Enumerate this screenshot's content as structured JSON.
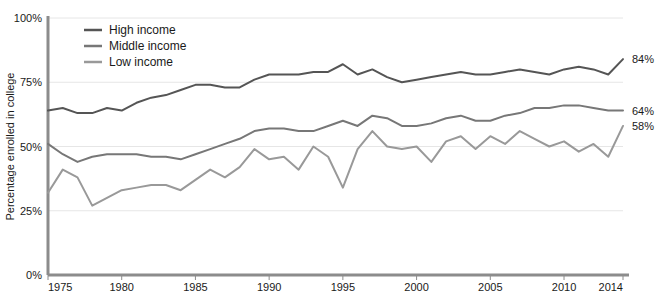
{
  "chart_data": {
    "type": "line",
    "title": "",
    "subtitle": "",
    "xlabel": "",
    "ylabel": "Percentage enrolled in college",
    "xlim": [
      1975,
      2014
    ],
    "ylim": [
      0,
      100
    ],
    "grid": true,
    "grid_axis": "y",
    "legend_position": "top-left",
    "x_ticks": [
      "1975",
      "1980",
      "1985",
      "1990",
      "1995",
      "2000",
      "2005",
      "2010",
      "2014"
    ],
    "x_tick_values": [
      1975,
      1980,
      1985,
      1990,
      1995,
      2000,
      2005,
      2010,
      2014
    ],
    "y_ticks": [
      "0%",
      "25%",
      "50%",
      "75%",
      "100%"
    ],
    "y_tick_values": [
      0,
      25,
      50,
      75,
      100
    ],
    "x": [
      1975,
      1976,
      1977,
      1978,
      1979,
      1980,
      1981,
      1982,
      1983,
      1984,
      1985,
      1986,
      1987,
      1988,
      1989,
      1990,
      1991,
      1992,
      1993,
      1994,
      1995,
      1996,
      1997,
      1998,
      1999,
      2000,
      2001,
      2002,
      2003,
      2004,
      2005,
      2006,
      2007,
      2008,
      2009,
      2010,
      2011,
      2012,
      2013,
      2014
    ],
    "series": [
      {
        "name": "High income",
        "color": "#555555",
        "end_label": "84%",
        "end_value": 84,
        "values": [
          64,
          65,
          63,
          63,
          65,
          64,
          67,
          69,
          70,
          72,
          74,
          74,
          73,
          73,
          76,
          78,
          78,
          78,
          79,
          79,
          82,
          78,
          80,
          77,
          75,
          76,
          77,
          78,
          79,
          78,
          78,
          79,
          80,
          79,
          78,
          80,
          81,
          80,
          78,
          84
        ]
      },
      {
        "name": "Middle income",
        "color": "#777777",
        "end_label": "64%",
        "end_value": 64,
        "values": [
          51,
          47,
          44,
          46,
          47,
          47,
          47,
          46,
          46,
          45,
          47,
          49,
          51,
          53,
          56,
          57,
          57,
          56,
          56,
          58,
          60,
          58,
          62,
          61,
          58,
          58,
          59,
          61,
          62,
          60,
          60,
          62,
          63,
          65,
          65,
          66,
          66,
          65,
          64,
          64
        ]
      },
      {
        "name": "Low income",
        "color": "#999999",
        "end_label": "58%",
        "end_value": 58,
        "values": [
          32,
          41,
          38,
          27,
          30,
          33,
          34,
          35,
          35,
          33,
          37,
          41,
          38,
          42,
          49,
          45,
          46,
          41,
          50,
          46,
          34,
          49,
          56,
          50,
          49,
          50,
          44,
          52,
          54,
          49,
          54,
          51,
          56,
          53,
          50,
          52,
          48,
          51,
          46,
          58
        ]
      }
    ]
  },
  "legend": {
    "items": [
      {
        "label": "High income"
      },
      {
        "label": "Middle income"
      },
      {
        "label": "Low income"
      }
    ]
  },
  "axes": {
    "y_axis_title": "Percentage enrolled in college"
  }
}
